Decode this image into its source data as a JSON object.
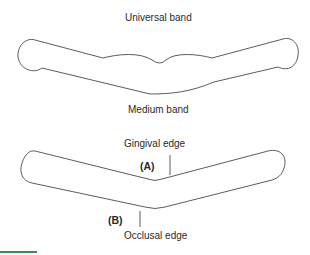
{
  "figure": {
    "universal_band": {
      "title": "Universal band"
    },
    "medium_band": {
      "title": "Medium band",
      "gingival_label": "Gingival edge",
      "occlusal_label": "Occlusal edge",
      "marker_a": "(A)",
      "marker_b": "(B)"
    }
  },
  "colors": {
    "stroke": "#4a4a4a",
    "text": "#2a2a2a",
    "accent_bar": "#3a8a5a"
  }
}
